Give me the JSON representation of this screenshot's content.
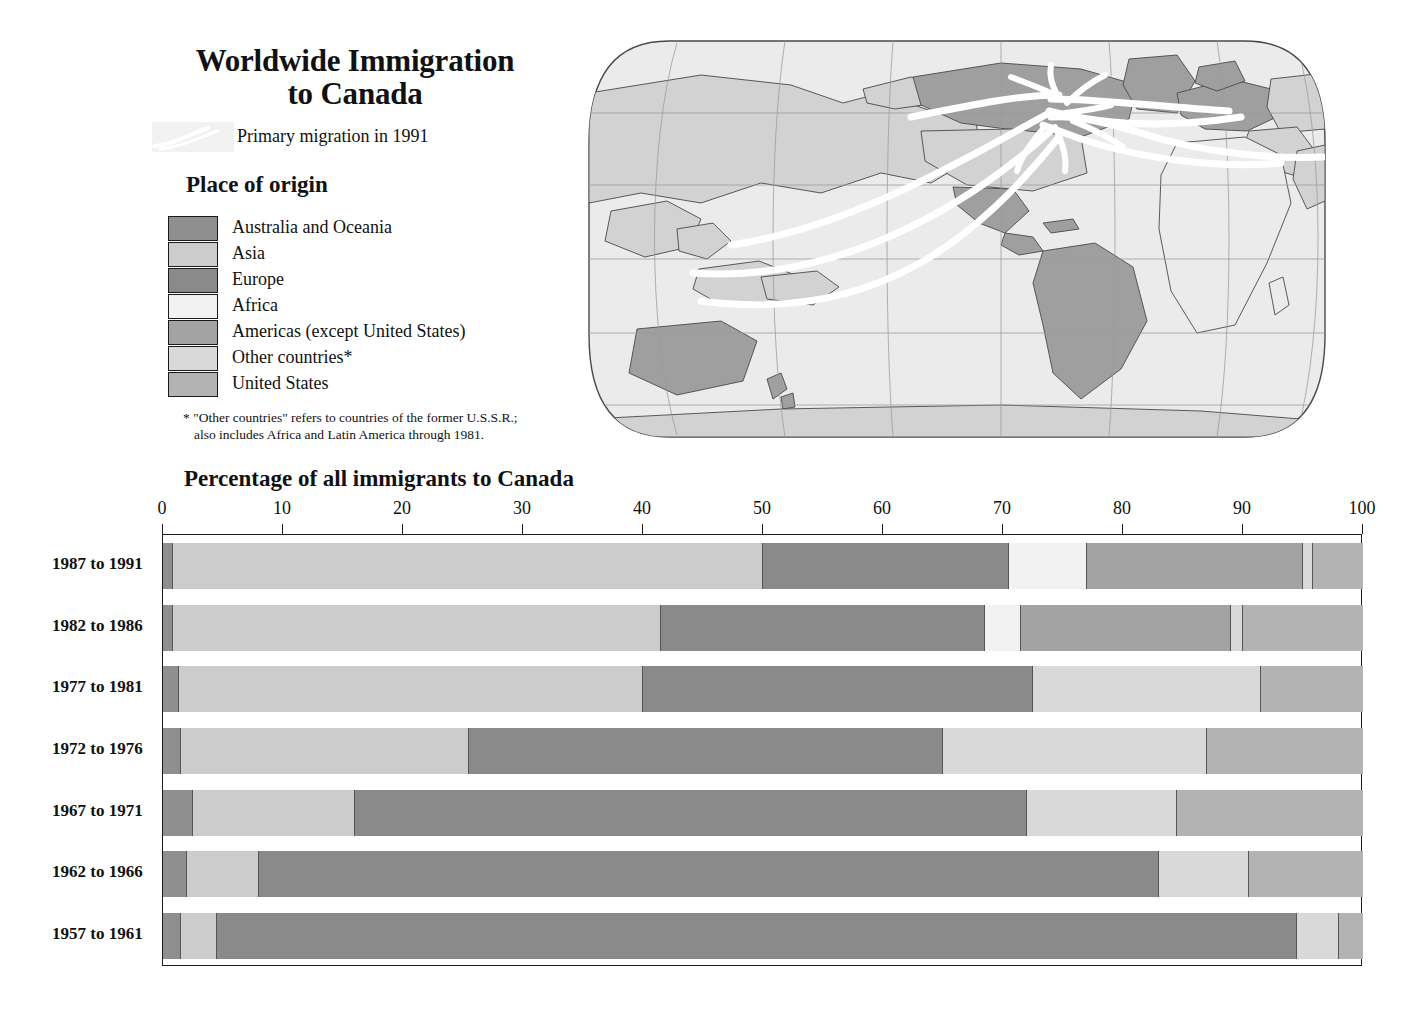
{
  "title": {
    "line1": "Worldwide Immigration",
    "line2": "to Canada"
  },
  "flow_legend": {
    "label": "Primary migration in 1991",
    "swatch_name": "migration-flow-swatch"
  },
  "origin_legend": {
    "heading": "Place of origin",
    "items": [
      {
        "label": "Australia and Oceania",
        "color": "#8f8f8f"
      },
      {
        "label": "Asia",
        "color": "#cccccc"
      },
      {
        "label": "Europe",
        "color": "#8a8a8a"
      },
      {
        "label": "Africa",
        "color": "#f2f2f2"
      },
      {
        "label": "Americas (except United States)",
        "color": "#a3a3a3"
      },
      {
        "label": "Other countries*",
        "color": "#d9d9d9"
      },
      {
        "label": "United States",
        "color": "#b3b3b3"
      }
    ]
  },
  "footnote": {
    "line1": "* \"Other countries\" refers to countries of the former U.S.S.R.;",
    "line2": "also includes Africa and Latin America through 1981."
  },
  "map": {
    "name": "world-map-robinson",
    "ocean_color": "#ebebeb",
    "land_color": "#d2d2d2",
    "highlight_land_color": "#a0a0a0",
    "graticule_color": "#9a9a9a",
    "flow_color": "#ffffff",
    "outline_color": "#4a4a4a"
  },
  "chart_data": {
    "type": "bar",
    "subtype": "stacked-horizontal-100",
    "title": "Percentage of all immigrants to Canada",
    "xlabel": "",
    "ylabel": "",
    "xlim": [
      0,
      100
    ],
    "grid": false,
    "legend_position": "left-panel",
    "xticks": [
      0,
      10,
      20,
      30,
      40,
      50,
      60,
      70,
      80,
      90,
      100
    ],
    "categories": [
      "1987 to 1991",
      "1982 to 1986",
      "1977 to 1981",
      "1972 to 1976",
      "1967 to 1971",
      "1962 to 1966",
      "1957 to 1961"
    ],
    "series": [
      {
        "name": "Australia and Oceania",
        "color": "#8f8f8f",
        "values": [
          0.8,
          0.8,
          1.3,
          1.5,
          2.5,
          2.0,
          1.5
        ]
      },
      {
        "name": "Asia",
        "color": "#cccccc",
        "values": [
          49.2,
          40.7,
          38.7,
          24.0,
          13.5,
          6.0,
          3.0
        ]
      },
      {
        "name": "Europe",
        "color": "#8a8a8a",
        "values": [
          20.5,
          27.0,
          32.5,
          39.5,
          56.0,
          75.0,
          90.0
        ]
      },
      {
        "name": "Africa",
        "color": "#f2f2f2",
        "values": [
          6.5,
          3.0,
          0.0,
          0.0,
          0.0,
          0.0,
          0.0
        ]
      },
      {
        "name": "Americas (except United States)",
        "color": "#a3a3a3",
        "values": [
          18.0,
          17.5,
          0.0,
          0.0,
          0.0,
          0.0,
          0.0
        ]
      },
      {
        "name": "Other countries*",
        "color": "#d9d9d9",
        "values": [
          0.8,
          1.0,
          19.0,
          22.0,
          12.5,
          7.5,
          3.5
        ]
      },
      {
        "name": "United States",
        "color": "#b3b3b3",
        "values": [
          4.2,
          10.0,
          8.5,
          13.0,
          15.5,
          9.5,
          2.0
        ]
      }
    ]
  }
}
